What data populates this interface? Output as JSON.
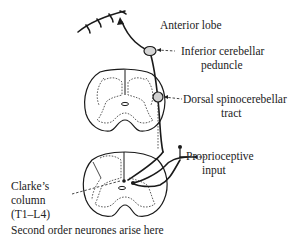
{
  "diagram": {
    "type": "anatomical pathway",
    "subject": "Dorsal spinocerebellar tract",
    "labels": {
      "anterior_lobe": "Anterior lobe",
      "inferior_peduncle_line1": "Inferior cerebellar",
      "inferior_peduncle_line2": "peduncle",
      "dorsal_tract_line1": "Dorsal spinocerebellar",
      "dorsal_tract_line2": "tract",
      "proprioceptive_line1": "Proprioceptive",
      "proprioceptive_line2": "input",
      "clarke_line1": "Clarke’s",
      "clarke_line2": "column",
      "clarke_line3": "(T1–L4)",
      "caption": "Second order neurones arise here"
    },
    "structures": [
      "cerebellum-anterior-lobe",
      "inferior-cerebellar-peduncle",
      "upper-spinal-cord-section",
      "lower-spinal-cord-section",
      "clarkes-column",
      "dorsal-root-input"
    ],
    "colors": {
      "ink": "#1a1a1a",
      "background": "#ffffff"
    }
  }
}
